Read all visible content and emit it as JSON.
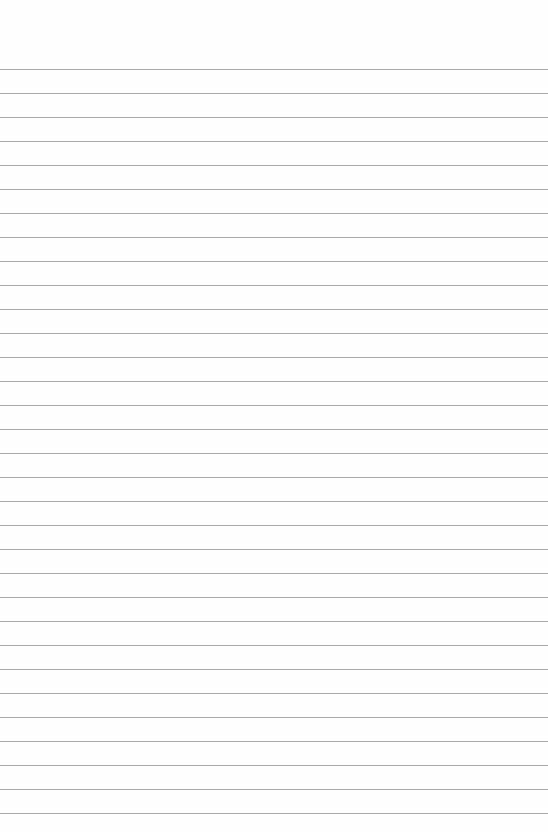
{
  "page": {
    "type": "blank lined paper",
    "line_count": 32,
    "first_line_y": 69,
    "line_spacing": 24.0,
    "line_color": "#a9a9a9",
    "background": "#fefefe"
  }
}
